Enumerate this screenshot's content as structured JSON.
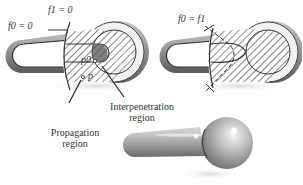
{
  "figure": {
    "panels": [
      {
        "id": "left-shape",
        "labels": {
          "f0": "f0 = 0",
          "f1": "f1 = 0",
          "p0": "p0",
          "p": "p"
        },
        "annotations": [
          {
            "text": "Propagation\nregion",
            "line1": "Propagation",
            "line2": "region"
          },
          {
            "text": "Interpenetration\nregion",
            "line1": "Interpenetration",
            "line2": "region"
          }
        ]
      },
      {
        "id": "right-shape",
        "labels": {
          "f0eqf1": "f0 = f1"
        }
      },
      {
        "id": "blended-result",
        "description": "3D rendered rod with spherical head"
      }
    ]
  }
}
